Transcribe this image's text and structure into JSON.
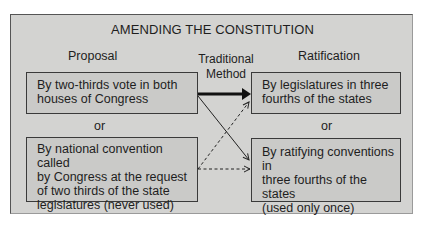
{
  "title": "AMENDING THE CONSTITUTION",
  "columns": {
    "proposal": "Proposal",
    "ratification": "Ratification"
  },
  "method_label": {
    "line1": "Traditional",
    "line2": "Method"
  },
  "proposal_boxes": [
    {
      "lines": [
        "By two-thirds vote in both",
        "houses of Congress"
      ]
    },
    {
      "lines": [
        "By national convention called",
        "by Congress at the request",
        "of two thirds of the state",
        "legislatures (never used)"
      ]
    }
  ],
  "ratification_boxes": [
    {
      "lines": [
        "By legislatures in three",
        "fourths of the states"
      ]
    },
    {
      "lines": [
        "By ratifying conventions in",
        "three fourths of the states",
        "(used only once)"
      ]
    }
  ],
  "separator": "or",
  "arrows": [
    {
      "from": "proposal_0",
      "to": "ratification_0",
      "style": "thick-solid",
      "label": "Traditional Method"
    },
    {
      "from": "proposal_0",
      "to": "ratification_1",
      "style": "solid"
    },
    {
      "from": "proposal_1",
      "to": "ratification_0",
      "style": "dashed"
    },
    {
      "from": "proposal_1",
      "to": "ratification_1",
      "style": "dashed"
    }
  ],
  "colors": {
    "panel": "#d3d3d1",
    "box": "#cacac8",
    "border": "#3a3a3a",
    "text": "#1e1e1e"
  }
}
